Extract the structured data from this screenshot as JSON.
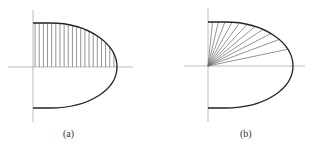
{
  "figures": [
    {
      "id": "a",
      "caption": "(a)",
      "description": "Half-ellipse region above axis filled with vertical strips",
      "hatching": "vertical",
      "strip_count": 20
    },
    {
      "id": "b",
      "caption": "(b)",
      "description": "Half-ellipse region above axis divided by rays from origin",
      "hatching": "radial",
      "ray_count": 11
    }
  ],
  "colors": {
    "curve": "#222222",
    "axis": "#aaaaaa",
    "hatch": "#666666"
  }
}
